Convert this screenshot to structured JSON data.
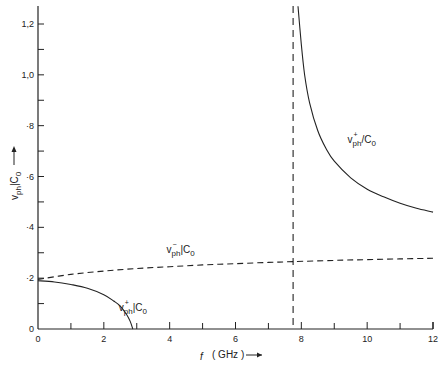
{
  "chart_data": {
    "type": "line",
    "title": "",
    "xlabel": "f (GHz)",
    "ylabel": "v_ph / c_0",
    "xlim": [
      0,
      12
    ],
    "ylim": [
      0,
      1.25
    ],
    "grid": false,
    "x_ticks": [
      0,
      2,
      4,
      6,
      8,
      10,
      12
    ],
    "x_tick_labels": [
      "0",
      "2",
      "4",
      "6",
      "8",
      "10",
      "12"
    ],
    "x_minor_ticks": [
      1,
      3,
      5,
      7,
      9,
      11
    ],
    "y_ticks": [
      0,
      0.2,
      0.4,
      0.6,
      0.8,
      1.0,
      1.2
    ],
    "y_tick_labels": [
      "0",
      "·2",
      "·4",
      "·6",
      "·8",
      "1,0",
      "1,2"
    ],
    "y_minor_ticks": [
      0.1,
      0.3,
      0.5,
      0.7,
      0.9,
      1.1
    ],
    "series": [
      {
        "name": "v_ph^+ / c_0 (lower branch)",
        "style": "solid",
        "x": [
          0,
          0.5,
          1.0,
          1.5,
          2.0,
          2.3,
          2.5,
          2.7,
          2.8,
          2.88
        ],
        "y": [
          0.19,
          0.185,
          0.175,
          0.16,
          0.135,
          0.11,
          0.09,
          0.055,
          0.03,
          0.0
        ]
      },
      {
        "name": "v_ph^- / c_0",
        "style": "dashed",
        "x": [
          0,
          1,
          2,
          3,
          4,
          5,
          6,
          7,
          7.75,
          9,
          10,
          11,
          12
        ],
        "y": [
          0.195,
          0.215,
          0.228,
          0.238,
          0.245,
          0.252,
          0.257,
          0.262,
          0.265,
          0.27,
          0.273,
          0.276,
          0.278
        ]
      },
      {
        "name": "v_ph^+ / c_0 (upper branch)",
        "style": "solid",
        "x": [
          7.9,
          8.0,
          8.1,
          8.25,
          8.5,
          8.75,
          9.0,
          9.5,
          10.0,
          10.5,
          11.0,
          11.5,
          12.0
        ],
        "y": [
          1.27,
          1.12,
          1.0,
          0.89,
          0.78,
          0.71,
          0.66,
          0.595,
          0.55,
          0.52,
          0.495,
          0.475,
          0.46
        ]
      }
    ],
    "vertical_lines": [
      {
        "x": 7.75,
        "style": "dashed"
      }
    ],
    "annotations": [
      {
        "text_main": "v",
        "sub": "ph",
        "sup": "+",
        "rest": "/C",
        "rest_sub": "0",
        "x": 9.4,
        "y": 0.73,
        "label": "v_ph^+ / c_0"
      },
      {
        "text_main": "v",
        "sub": "ph",
        "sup": "−",
        "rest": "|C",
        "rest_sub": "0",
        "x": 3.9,
        "y": 0.3,
        "label": "v_ph^- | c_0"
      },
      {
        "text_main": "v",
        "sub": "ph",
        "sup": "+",
        "rest": "|C",
        "rest_sub": "0",
        "x": 2.45,
        "y": 0.07,
        "label": "v_ph^+ | c_0"
      }
    ],
    "legend": null
  },
  "labels": {
    "x_axis_title_f": "f",
    "x_axis_title_unit": "( GHz )",
    "y_axis_title": "v",
    "y_axis_title_sub": "ph",
    "y_axis_title_rest": "|C",
    "y_axis_title_rest_sub": "0"
  }
}
